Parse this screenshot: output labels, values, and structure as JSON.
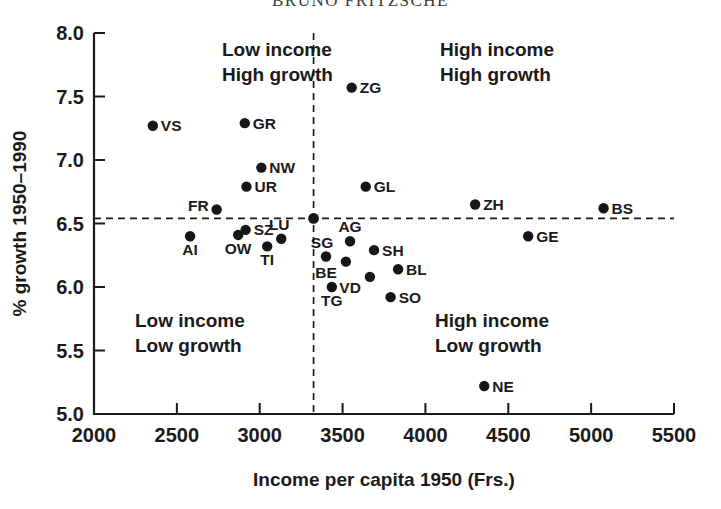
{
  "title": "BRUNO FRITZSCHE",
  "axes": {
    "x": {
      "label": "Income per capita 1950 (Frs.)",
      "ticks": [
        "2000",
        "2500",
        "3000",
        "3500",
        "4000",
        "4500",
        "5000",
        "5500"
      ],
      "min": 2000,
      "max": 5500
    },
    "y": {
      "label": "% growth 1950–1990",
      "ticks": [
        "8.0",
        "7.5",
        "7.0",
        "6.5",
        "6.0",
        "5.5",
        "5.0"
      ],
      "min": 5.0,
      "max": 8.0
    }
  },
  "quadrants": [
    {
      "name": "top-left",
      "line1": "Low income",
      "line2": "High growth"
    },
    {
      "name": "top-right",
      "line1": "High income",
      "line2": "High growth"
    },
    {
      "name": "bottom-left",
      "line1": "Low income",
      "line2": "Low growth"
    },
    {
      "name": "bottom-right",
      "line1": "High income",
      "line2": "Low growth"
    }
  ],
  "chart_data": {
    "type": "scatter",
    "title": "BRUNO FRITZSCHE",
    "xlabel": "Income per capita 1950 (Frs.)",
    "ylabel": "% growth 1950–1990",
    "xlim": [
      2000,
      5500
    ],
    "ylim": [
      5.0,
      8.0
    ],
    "xticks": [
      2000,
      2500,
      3000,
      3500,
      4000,
      4500,
      5000,
      5500
    ],
    "yticks": [
      5.0,
      5.5,
      6.0,
      6.5,
      7.0,
      7.5,
      8.0
    ],
    "grid": false,
    "legend": null,
    "reference_lines": {
      "vertical_x": 3325,
      "horizontal_y": 6.54,
      "style": "dashed",
      "intersection_marker": true
    },
    "annotations": [
      "Low income / High growth",
      "High income / High growth",
      "Low income / Low growth",
      "High income / Low growth"
    ],
    "points": [
      {
        "label": "VS",
        "x": 2355,
        "y": 7.27,
        "label_pos": "right"
      },
      {
        "label": "GR",
        "x": 2910,
        "y": 7.29,
        "label_pos": "right"
      },
      {
        "label": "ZG",
        "x": 3555,
        "y": 7.57,
        "label_pos": "right"
      },
      {
        "label": "NW",
        "x": 3010,
        "y": 6.94,
        "label_pos": "right"
      },
      {
        "label": "UR",
        "x": 2920,
        "y": 6.79,
        "label_pos": "right"
      },
      {
        "label": "FR",
        "x": 2740,
        "y": 6.61,
        "label_pos": "left"
      },
      {
        "label": "GL",
        "x": 3640,
        "y": 6.79,
        "label_pos": "right"
      },
      {
        "label": "ZH",
        "x": 4300,
        "y": 6.65,
        "label_pos": "right"
      },
      {
        "label": "BS",
        "x": 5075,
        "y": 6.62,
        "label_pos": "right"
      },
      {
        "label": "GE",
        "x": 4620,
        "y": 6.4,
        "label_pos": "right"
      },
      {
        "label": "AI",
        "x": 2580,
        "y": 6.4,
        "label_pos": "below"
      },
      {
        "label": "OW",
        "x": 2870,
        "y": 6.41,
        "label_pos": "below"
      },
      {
        "label": "SZ",
        "x": 2915,
        "y": 6.45,
        "label_pos": "right"
      },
      {
        "label": "TI",
        "x": 3045,
        "y": 6.32,
        "label_pos": "below"
      },
      {
        "label": "LU",
        "x": 3130,
        "y": 6.38,
        "label_pos": "above-right"
      },
      {
        "label": "SG",
        "x": 3400,
        "y": 6.24,
        "label_pos": "above-left"
      },
      {
        "label": "AG",
        "x": 3545,
        "y": 6.36,
        "label_pos": "above"
      },
      {
        "label": "SH",
        "x": 3690,
        "y": 6.29,
        "label_pos": "right"
      },
      {
        "label": "BE",
        "x": 3520,
        "y": 6.2,
        "label_pos": "below-left"
      },
      {
        "label": "VD",
        "x": 3665,
        "y": 6.08,
        "label_pos": "below-left"
      },
      {
        "label": "BL",
        "x": 3835,
        "y": 6.14,
        "label_pos": "right"
      },
      {
        "label": "TG",
        "x": 3435,
        "y": 6.0,
        "label_pos": "below"
      },
      {
        "label": "SO",
        "x": 3790,
        "y": 5.92,
        "label_pos": "right"
      },
      {
        "label": "NE",
        "x": 4355,
        "y": 5.22,
        "label_pos": "right"
      }
    ]
  }
}
